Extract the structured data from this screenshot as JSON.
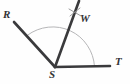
{
  "figure": {
    "kind": "geometry-diagram",
    "width": 130,
    "height": 84,
    "background_color": "#fefefe"
  },
  "labels": {
    "R": "R",
    "W": "W",
    "S": "S",
    "T": "T"
  },
  "colors": {
    "ray_stroke": "#3a3a3c",
    "arc_stroke": "#b6b6b8",
    "tick_stroke": "#8e8e90",
    "label_color": "#333335"
  },
  "points": {
    "S": {
      "x": 55,
      "y": 67,
      "role": "vertex"
    },
    "R": {
      "x": 14,
      "y": 22,
      "role": "ray-endpoint"
    },
    "W": {
      "x": 79,
      "y": 1,
      "role": "ray-endpoint"
    },
    "T": {
      "x": 110,
      "y": 66,
      "role": "ray-endpoint"
    }
  },
  "rays": [
    {
      "name": "ray-SR",
      "from": "S",
      "to": "R",
      "x1": 55,
      "y1": 67,
      "x2": 14,
      "y2": 22
    },
    {
      "name": "ray-SW",
      "from": "S",
      "to": "W",
      "x1": 55,
      "y1": 67,
      "x2": 79,
      "y2": 1
    },
    {
      "name": "ray-ST",
      "from": "S",
      "to": "T",
      "x1": 55,
      "y1": 67,
      "x2": 110,
      "y2": 66
    }
  ],
  "arc": {
    "name": "construction-arc",
    "center_x": 55,
    "center_y": 67,
    "radius": 42,
    "start_x": 28,
    "start_y": 35,
    "end_x": 94,
    "end_y": 66,
    "path": "M 27.5 35.2 A 42 42 0 0 1 94.5 66.4"
  },
  "tick_marks": {
    "name": "arc-intersection-mark",
    "center_x": 75,
    "center_y": 12,
    "strokes": [
      {
        "x1": 69,
        "y1": 9,
        "x2": 81,
        "y2": 16
      },
      {
        "x1": 70,
        "y1": 16,
        "x2": 80,
        "y2": 8
      }
    ]
  }
}
